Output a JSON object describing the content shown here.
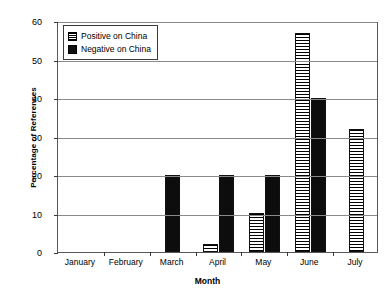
{
  "chart_data": {
    "type": "bar",
    "title": "",
    "xlabel": "Month",
    "ylabel": "Percentage of References",
    "categories": [
      "January",
      "February",
      "March",
      "April",
      "May",
      "June",
      "July"
    ],
    "series": [
      {
        "name": "Positive on China",
        "values": [
          0,
          0,
          0,
          2,
          10,
          57,
          32
        ]
      },
      {
        "name": "Negative on China",
        "values": [
          0,
          0,
          20,
          20,
          20,
          40,
          0
        ]
      }
    ],
    "ylim": [
      0,
      60
    ],
    "yticks": [
      0,
      10,
      20,
      30,
      40,
      50,
      60
    ],
    "ytick_labels": [
      "0",
      "10",
      "20",
      "30",
      "40",
      "50",
      "60"
    ],
    "grid": "horizontal",
    "legend_position": "top-left"
  },
  "legend": {
    "items": [
      {
        "label": "Positive on China",
        "swatch": "horizontal-stripes-swatch"
      },
      {
        "label": "Negative on China",
        "swatch": "solid-black-swatch"
      }
    ]
  },
  "axes": {
    "y_title": "Percentage of References",
    "x_title": "Month"
  }
}
